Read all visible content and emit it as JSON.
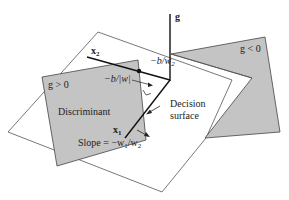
{
  "diagram": {
    "colors": {
      "background": "#ffffff",
      "plane_fill": "#ffffff",
      "plane_stroke": "#555555",
      "region_fill": "#c4c4c4",
      "region_stroke": "#444444",
      "axis_stroke": "#111111",
      "text": "#222222"
    },
    "axes": {
      "g": "g",
      "x1": "x",
      "x1_sub": "1",
      "x2": "x",
      "x2_sub": "2"
    },
    "regions": {
      "positive": "g > 0",
      "negative": "g < 0"
    },
    "labels": {
      "discriminant": "Discriminant",
      "decision_line1": "Decision",
      "decision_line2": "surface",
      "intercept_x2": "−b/w",
      "intercept_x2_sub": "2",
      "distance": "−b/|w|",
      "slope_prefix": "Slope = −w",
      "slope_sub1": "1",
      "slope_mid": "/w",
      "slope_sub2": "2"
    }
  }
}
